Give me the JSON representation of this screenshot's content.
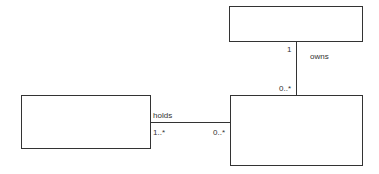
{
  "diagram": {
    "type": "UML class diagram",
    "classes": [
      {
        "id": "top",
        "name": ""
      },
      {
        "id": "bottom-right",
        "name": ""
      },
      {
        "id": "left",
        "name": ""
      }
    ],
    "associations": [
      {
        "name": "owns",
        "from": "top",
        "to": "bottom-right",
        "from_multiplicity": "1",
        "to_multiplicity": "0..*"
      },
      {
        "name": "holds",
        "from": "left",
        "to": "bottom-right",
        "from_multiplicity": "1..*",
        "to_multiplicity": "0..*"
      }
    ]
  },
  "colors": {
    "stroke": "#333333",
    "background": "#ffffff"
  }
}
